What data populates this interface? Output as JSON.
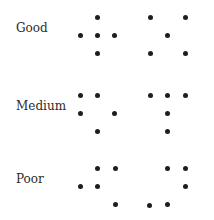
{
  "rows": [
    {
      "label": "Good",
      "label_y": 28,
      "left_pattern": [
        [
          80,
          35
        ],
        [
          97,
          17
        ],
        [
          97,
          35
        ],
        [
          97,
          53
        ],
        [
          114,
          35
        ]
      ],
      "right_pattern": [
        [
          150,
          17
        ],
        [
          185,
          17
        ],
        [
          167,
          35
        ],
        [
          150,
          53
        ],
        [
          185,
          53
        ]
      ]
    },
    {
      "label": "Medium",
      "label_y": 106,
      "left_pattern": [
        [
          80,
          95
        ],
        [
          97,
          95
        ],
        [
          80,
          113
        ],
        [
          114,
          113
        ],
        [
          97,
          131
        ]
      ],
      "right_pattern": [
        [
          150,
          95
        ],
        [
          167,
          95
        ],
        [
          185,
          95
        ],
        [
          167,
          113
        ],
        [
          167,
          131
        ]
      ]
    },
    {
      "label": "Poor",
      "label_y": 179,
      "left_pattern": [
        [
          97,
          168
        ],
        [
          115,
          168
        ],
        [
          80,
          186
        ],
        [
          97,
          186
        ],
        [
          115,
          204
        ]
      ],
      "right_pattern": [
        [
          167,
          168
        ],
        [
          185,
          168
        ],
        [
          185,
          186
        ],
        [
          167,
          204
        ],
        [
          149,
          205
        ]
      ]
    }
  ],
  "colors": {
    "dot": "#1e1e1e",
    "text": "#2a2a2a",
    "background": "#ffffff"
  }
}
